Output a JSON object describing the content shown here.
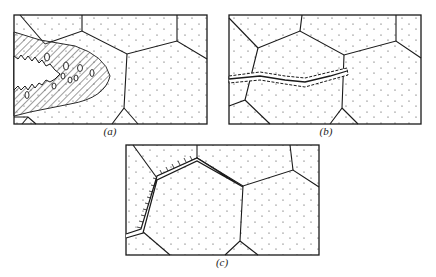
{
  "figure": {
    "panels": [
      {
        "id": "a",
        "label": "(a)",
        "description": "Intergranular crack with wide hatched plastic zone containing voids ahead of the tip"
      },
      {
        "id": "b",
        "label": "(b)",
        "description": "Narrow transgranular crack with thin hatched zone crossing grain boundary"
      },
      {
        "id": "c",
        "label": "(c)",
        "description": "Crack along grain boundary with hatch marks on the boundary"
      }
    ],
    "colors": {
      "line": "#1a1a1a",
      "background": "#ffffff",
      "dots": "#333333"
    }
  }
}
